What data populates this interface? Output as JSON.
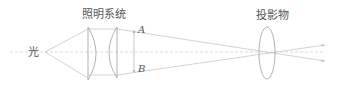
{
  "diagram": {
    "labels": {
      "light_source": "光",
      "illumination_system": "照明系统",
      "point_a": "A",
      "point_b": "B",
      "projected_object": "投影物"
    },
    "colors": {
      "line": "#b8b8b8",
      "lens": "#a8a8a8",
      "text": "#555555"
    }
  }
}
